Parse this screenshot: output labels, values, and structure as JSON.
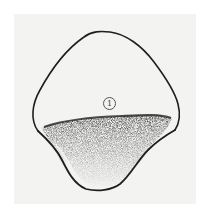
{
  "figure": {
    "label": "1",
    "colors": {
      "background": "#ffffff",
      "paper": "#f3f3f1",
      "outline": "#1e1e1e",
      "shading": "#2a2a2a"
    }
  }
}
